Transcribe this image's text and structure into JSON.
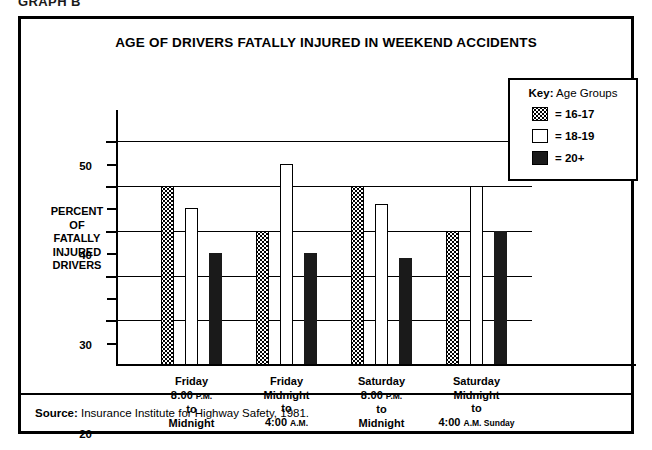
{
  "page": {
    "graph_caption": "GRAPH B"
  },
  "chart": {
    "title": "AGE OF DRIVERS FATALLY INJURED IN WEEKEND ACCIDENTS",
    "y_axis_caption_lines": [
      "PERCENT",
      "OF",
      "FATALLY",
      "INJURED",
      "DRIVERS"
    ],
    "source_label": "Source:",
    "source_text": " Insurance Institute for Highway Safety, 1981."
  },
  "legend": {
    "title_key": "Key:",
    "title_rest": " Age Groups",
    "items": [
      {
        "swatch": "stipple",
        "label": "= 16-17"
      },
      {
        "swatch": "white",
        "label": "= 18-19"
      },
      {
        "swatch": "black",
        "label": "= 20+"
      }
    ]
  },
  "categories_display": [
    {
      "l1": "Friday",
      "l2": "8:00 ",
      "l2b": "P.M.",
      "l3": "to",
      "l4": "Midnight",
      "l4b": ""
    },
    {
      "l1": "Friday",
      "l2": "Midnight",
      "l2b": "",
      "l3": "to",
      "l4": "4:00 ",
      "l4b": "A.M."
    },
    {
      "l1": "Saturday",
      "l2": "8:00 ",
      "l2b": "P.M.",
      "l3": "to",
      "l4": "Midnight",
      "l4b": ""
    },
    {
      "l1": "Saturday",
      "l2": "Midnight",
      "l2b": "",
      "l3": "to",
      "l4": "4:00 ",
      "l4b": "A.M. Sunday"
    }
  ],
  "chart_data": {
    "type": "bar",
    "title": "AGE OF DRIVERS FATALLY INJURED IN WEEKEND ACCIDENTS",
    "xlabel": "",
    "ylabel": "PERCENT OF FATALLY INJURED DRIVERS",
    "ylim": [
      0,
      55
    ],
    "y_major_ticks": [
      10,
      20,
      30,
      40,
      50
    ],
    "y_minor_ticks": [
      5,
      15,
      25,
      35,
      45
    ],
    "grid": true,
    "legend_position": "top-right",
    "categories": [
      "Friday 8:00 P.M. to Midnight",
      "Friday Midnight to 4:00 A.M.",
      "Saturday 8:00 P.M. to Midnight",
      "Saturday Midnight to 4:00 A.M. Sunday"
    ],
    "series": [
      {
        "name": "16-17",
        "fill": "stipple",
        "values": [
          40,
          30,
          40,
          30
        ]
      },
      {
        "name": "18-19",
        "fill": "white",
        "values": [
          35,
          45,
          36,
          40
        ]
      },
      {
        "name": "20+",
        "fill": "black",
        "values": [
          25,
          25,
          24,
          30
        ]
      }
    ],
    "source": "Insurance Institute for Highway Safety, 1981."
  }
}
